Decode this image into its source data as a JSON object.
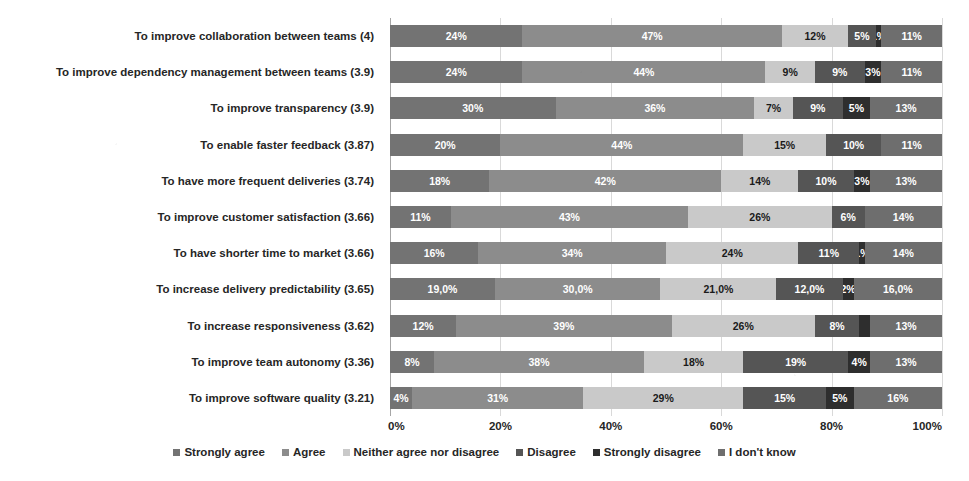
{
  "chart_data": {
    "type": "bar",
    "orientation": "horizontal",
    "stacked": true,
    "stack_mode": "percent",
    "title": "",
    "subtitle": "",
    "xlabel": "",
    "ylabel": "",
    "xlim": [
      0,
      100
    ],
    "xticks": [
      "0%",
      "20%",
      "40%",
      "60%",
      "80%",
      "100%"
    ],
    "xtick_values": [
      0,
      20,
      40,
      60,
      80,
      100
    ],
    "grid": true,
    "grid_axis": "x",
    "legend_position": "bottom",
    "categories": [
      "To improve collaboration between teams (4)",
      "To improve dependency management between teams (3.9)",
      "To improve transparency (3.9)",
      "To enable faster feedback (3.87)",
      "To have more frequent deliveries (3.74)",
      "To improve customer satisfaction (3.66)",
      "To have shorter time to market (3.66)",
      "To increase delivery predictability (3.65)",
      "To increase responsiveness (3.62)",
      "To improve team autonomy (3.36)",
      "To improve software quality (3.21)"
    ],
    "series": [
      {
        "name": "Strongly agree",
        "color": "#737373",
        "values": [
          24,
          24,
          30,
          20,
          18,
          11,
          16,
          19,
          12,
          8,
          4
        ],
        "labels": [
          "24%",
          "24%",
          "30%",
          "20%",
          "18%",
          "11%",
          "16%",
          "19,0%",
          "12%",
          "8%",
          "4%"
        ]
      },
      {
        "name": "Agree",
        "color": "#8c8c8c",
        "values": [
          47,
          44,
          36,
          44,
          42,
          43,
          34,
          30,
          39,
          38,
          31
        ],
        "labels": [
          "47%",
          "44%",
          "36%",
          "44%",
          "42%",
          "43%",
          "34%",
          "30,0%",
          "39%",
          "38%",
          "31%"
        ]
      },
      {
        "name": "Neither agree nor disagree",
        "color": "#c9c9c9",
        "values": [
          12,
          9,
          7,
          15,
          14,
          26,
          24,
          21,
          26,
          18,
          29
        ],
        "labels": [
          "12%",
          "9%",
          "7%",
          "15%",
          "14%",
          "26%",
          "24%",
          "21,0%",
          "26%",
          "18%",
          "29%"
        ]
      },
      {
        "name": "Disagree",
        "color": "#555555",
        "values": [
          5,
          9,
          9,
          10,
          10,
          6,
          11,
          12,
          8,
          19,
          15
        ],
        "labels": [
          "5%",
          "9%",
          "9%",
          "10%",
          "10%",
          "6%",
          "11%",
          "12,0%",
          "8%",
          "19%",
          "15%"
        ]
      },
      {
        "name": "Strongly disagree",
        "color": "#2e2e2e",
        "values": [
          1,
          3,
          5,
          0,
          3,
          0,
          1,
          2,
          2,
          4,
          5
        ],
        "labels": [
          "1%",
          "3%",
          "5%",
          "",
          "3%",
          "0%",
          "1%",
          "2%",
          "",
          "4%",
          "5%"
        ]
      },
      {
        "name": "I don't know",
        "color": "#6e6e6e",
        "values": [
          11,
          11,
          13,
          11,
          13,
          14,
          14,
          16,
          13,
          13,
          16
        ],
        "labels": [
          "11%",
          "11%",
          "13%",
          "11%",
          "13%",
          "14%",
          "14%",
          "16,0%",
          "13%",
          "13%",
          "16%"
        ]
      }
    ]
  },
  "legend": {
    "items": [
      "Strongly agree",
      "Agree",
      "Neither agree nor disagree",
      "Disagree",
      "Strongly disagree",
      "I don't know"
    ]
  }
}
